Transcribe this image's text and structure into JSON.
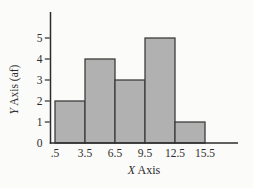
{
  "chart_data": {
    "type": "bar",
    "subtype": "histogram",
    "xlabel": "X Axis",
    "ylabel": "Y Axis (af)",
    "bin_edges": [
      0.5,
      3.5,
      6.5,
      9.5,
      12.5,
      15.5
    ],
    "bin_edge_labels": [
      ".5",
      "3.5",
      "6.5",
      "9.5",
      "12.5",
      "15.5"
    ],
    "values": [
      2,
      4,
      3,
      5,
      1
    ],
    "yticks": [
      0,
      1,
      2,
      3,
      4,
      5
    ],
    "ylim": [
      0,
      6.2
    ],
    "xlim": [
      0.5,
      18.8
    ],
    "grid": false,
    "legend": "none",
    "colors": {
      "bar_fill": "#b1b1b1",
      "bar_edge": "#3d3d3d",
      "axis": "#2c2c2c",
      "text": "#2c2c2c",
      "background": "#fbfbf9"
    }
  }
}
